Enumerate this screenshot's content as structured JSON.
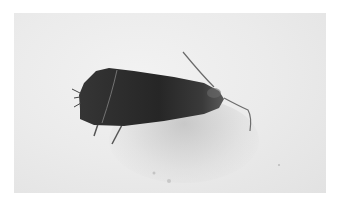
{
  "image": {
    "subject": "moth",
    "description": "Dark brown-black moth resting on a pale grey-white surface, with antennae pointing to the right",
    "colors": {
      "background_border": "#ffffff",
      "surface": "#ebebeb",
      "moth_body": "#2a2a2a",
      "shadow": "#b4b4b4"
    }
  }
}
